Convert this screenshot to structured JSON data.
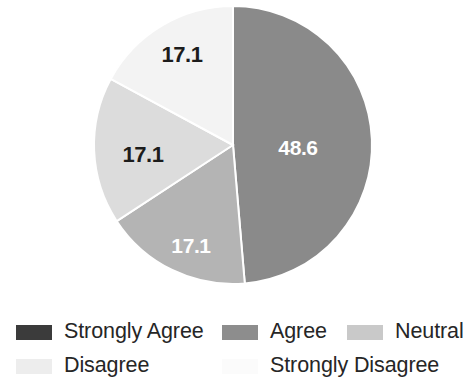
{
  "chart_data": {
    "type": "pie",
    "title": "",
    "subtitle": "",
    "xlabel": "",
    "ylabel": "",
    "grid": false,
    "legend_position": "bottom",
    "units": "percent",
    "start_angle_deg": 0,
    "direction": "clockwise",
    "categories": [
      "Strongly Agree",
      "Agree",
      "Neutral",
      "Disagree",
      "Strongly Disagree"
    ],
    "values": [
      48.6,
      17.1,
      17.1,
      17.1,
      0
    ],
    "data_labels": [
      "48.6",
      "17.1",
      "17.1",
      "17.1",
      ""
    ],
    "colors": [
      "#8a8a8a",
      "#b4b4b4",
      "#dcdcdc",
      "#f3f3f3",
      "#fcfcfc"
    ],
    "slices": [
      {
        "label": "Strongly Agree",
        "value": 48.6,
        "display": "48.6",
        "color": "#8a8a8a",
        "label_color": "#ffffff",
        "label_x": 298,
        "label_y": 148
      },
      {
        "label": "Agree",
        "value": 17.1,
        "display": "17.1",
        "color": "#b4b4b4",
        "label_color": "#ffffff",
        "label_x": 191,
        "label_y": 246
      },
      {
        "label": "Neutral",
        "value": 17.1,
        "display": "17.1",
        "color": "#dcdcdc",
        "label_color": "#1c1c1c",
        "label_x": 143,
        "label_y": 155
      },
      {
        "label": "Disagree",
        "value": 17.1,
        "display": "17.1",
        "color": "#f3f3f3",
        "label_color": "#1c1c1c",
        "label_x": 182,
        "label_y": 55
      },
      {
        "label": "Strongly Disagree",
        "value": 0,
        "display": "",
        "color": "#fcfcfc",
        "label_color": "#1c1c1c",
        "label_x": 0,
        "label_y": 0
      }
    ]
  },
  "pie": {
    "center_x": 233,
    "center_y": 145,
    "radius": 139,
    "separator_color": "#ffffff",
    "separator_width": 2
  },
  "legend": {
    "row1": [
      {
        "label": "Strongly Agree",
        "color": "#3b3b3b"
      },
      {
        "label": "Agree",
        "color": "#8d8d8d"
      },
      {
        "label": "Neutral",
        "color": "#c9c9c9"
      }
    ],
    "row2": [
      {
        "label": "Disagree",
        "color": "#ededed"
      },
      {
        "label": "Strongly Disagree",
        "color": "#fbfbfb"
      }
    ]
  }
}
